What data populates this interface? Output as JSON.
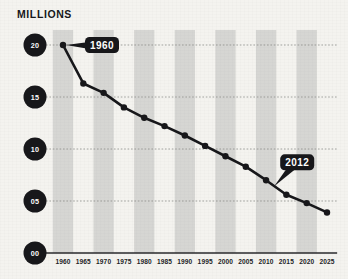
{
  "chart_data": {
    "type": "line",
    "title": "MILLIONS",
    "xlabel": "",
    "ylabel": "",
    "x": [
      1960,
      1965,
      1970,
      1975,
      1980,
      1985,
      1990,
      1995,
      2000,
      2005,
      2010,
      2015,
      2020,
      2025
    ],
    "values": [
      20.0,
      16.3,
      15.4,
      14.0,
      13.0,
      12.2,
      11.3,
      10.3,
      9.3,
      8.3,
      7.0,
      5.6,
      4.8,
      3.9
    ],
    "series": [
      {
        "name": "millions",
        "values": [
          20.0,
          16.3,
          15.4,
          14.0,
          13.0,
          12.2,
          11.3,
          10.3,
          9.3,
          8.3,
          7.0,
          5.6,
          4.8,
          3.9
        ]
      }
    ],
    "x_tick_labels": [
      "1960",
      "1965",
      "1970",
      "1975",
      "1980",
      "1985",
      "1990",
      "1995",
      "2000",
      "2005",
      "2010",
      "2015",
      "2020",
      "2025"
    ],
    "y_tick_labels": [
      "20",
      "15",
      "10",
      "05",
      "00"
    ],
    "y_tick_values": [
      20,
      15,
      10,
      5,
      0
    ],
    "ylim": [
      0,
      20
    ],
    "xlim": [
      1960,
      2025
    ],
    "grid": "horizontal-dotted",
    "legend": "none",
    "band_shading": "alternating-vertical-gray",
    "annotations": [
      {
        "label": "1960",
        "x": 1960,
        "y": 20.0
      },
      {
        "label": "2012",
        "x": 2012,
        "y": 6.6
      }
    ],
    "marker": "filled-circle",
    "line_color": "#17171a",
    "band_color": "#d6d6d3",
    "background_color": "#f4f3ef",
    "axis_bubble_color": "#17171a"
  }
}
